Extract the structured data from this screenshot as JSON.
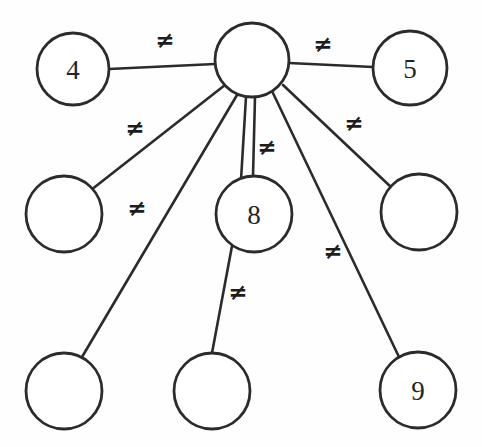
{
  "diagram": {
    "background_color": "#fefefe",
    "stroke_color": "#2b2b2b",
    "node_fill_color": "#ffffff",
    "label_color": "#232323",
    "width": 482,
    "height": 447,
    "nodes": [
      {
        "id": "hub",
        "label": "",
        "cx": 252,
        "cy": 60,
        "r": 37,
        "name": "node-hub"
      },
      {
        "id": "n4",
        "label": "4",
        "cx": 73,
        "cy": 69,
        "r": 36,
        "name": "node-4"
      },
      {
        "id": "n5",
        "label": "5",
        "cx": 410,
        "cy": 68,
        "r": 37,
        "name": "node-5"
      },
      {
        "id": "mid-left",
        "label": "",
        "cx": 64,
        "cy": 214,
        "r": 38,
        "name": "node-mid-left"
      },
      {
        "id": "n8",
        "label": "8",
        "cx": 254,
        "cy": 214,
        "r": 38,
        "name": "node-8"
      },
      {
        "id": "mid-right",
        "label": "",
        "cx": 419,
        "cy": 212,
        "r": 38,
        "name": "node-mid-right"
      },
      {
        "id": "bottom-left",
        "label": "",
        "cx": 64,
        "cy": 391,
        "r": 38,
        "name": "node-bottom-left"
      },
      {
        "id": "bottom-mid",
        "label": "",
        "cx": 212,
        "cy": 391,
        "r": 38,
        "name": "node-bottom-mid"
      },
      {
        "id": "n9",
        "label": "9",
        "cx": 418,
        "cy": 390,
        "r": 38,
        "name": "node-9"
      }
    ],
    "edges": [
      {
        "id": "e-hub-n4",
        "from": "hub",
        "to": "n4",
        "x1": 215,
        "y1": 64,
        "x2": 109,
        "y2": 69,
        "label": "≠",
        "lx": 165,
        "ly": 40,
        "name": "edge-hub-to-4"
      },
      {
        "id": "e-hub-n5",
        "from": "hub",
        "to": "n5",
        "x1": 289,
        "y1": 63,
        "x2": 373,
        "y2": 67,
        "label": "≠",
        "lx": 323,
        "ly": 44,
        "name": "edge-hub-to-5"
      },
      {
        "id": "e-hub-midleft",
        "from": "hub",
        "to": "mid-left",
        "x1": 225,
        "y1": 85,
        "x2": 91,
        "y2": 190,
        "label": "≠",
        "lx": 135,
        "ly": 128,
        "name": "edge-hub-to-mid-left"
      },
      {
        "id": "e-hub-bottomleft",
        "from": "hub",
        "to": "bottom-left",
        "x1": 237,
        "y1": 95,
        "x2": 82,
        "y2": 357,
        "label": "≠",
        "lx": 137,
        "ly": 208,
        "name": "edge-hub-to-bottom-left"
      },
      {
        "id": "e-hub-n8-a",
        "from": "hub",
        "to": "n8",
        "x1": 246,
        "y1": 97,
        "x2": 241,
        "y2": 180,
        "label": "",
        "lx": 0,
        "ly": 0,
        "name": "edge-hub-to-8-left"
      },
      {
        "id": "e-hub-n8-b",
        "from": "hub",
        "to": "n8",
        "x1": 255,
        "y1": 97,
        "x2": 253,
        "y2": 176,
        "label": "≠",
        "lx": 267,
        "ly": 147,
        "name": "edge-hub-to-8-right"
      },
      {
        "id": "e-hub-n9",
        "from": "hub",
        "to": "n9",
        "x1": 272,
        "y1": 91,
        "x2": 399,
        "y2": 357,
        "label": "≠",
        "lx": 333,
        "ly": 251,
        "name": "edge-hub-to-9"
      },
      {
        "id": "e-hub-midright",
        "from": "hub",
        "to": "mid-right",
        "x1": 283,
        "y1": 85,
        "x2": 392,
        "y2": 188,
        "label": "≠",
        "lx": 354,
        "ly": 123,
        "name": "edge-hub-to-mid-right"
      },
      {
        "id": "e-n8-bottommid",
        "from": "n8",
        "to": "bottom-mid",
        "x1": 232,
        "y1": 246,
        "x2": 212,
        "y2": 353,
        "label": "≠",
        "lx": 238,
        "ly": 292,
        "name": "edge-8-to-bottom-mid"
      }
    ]
  }
}
